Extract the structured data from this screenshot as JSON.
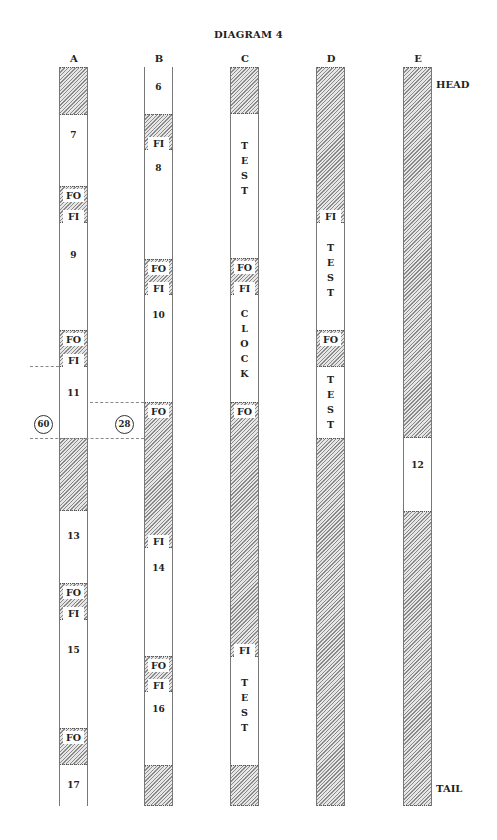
{
  "title": "DIAGRAM 4",
  "columns": [
    {
      "label": "A",
      "x": 59,
      "segments": [
        {
          "type": "hatch",
          "top": 67,
          "bottom": 115,
          "tags": []
        },
        {
          "type": "white",
          "top": 115,
          "bottom": 186,
          "number": "7",
          "number_y": 130
        },
        {
          "type": "hatch",
          "top": 186,
          "bottom": 223,
          "tags": [
            {
              "text": "FO",
              "y": 188
            },
            {
              "text": "FI",
              "y": 209
            }
          ]
        },
        {
          "type": "white",
          "top": 223,
          "bottom": 330,
          "number": "9",
          "number_y": 250
        },
        {
          "type": "hatch",
          "top": 330,
          "bottom": 367,
          "tags": [
            {
              "text": "FO",
              "y": 332
            },
            {
              "text": "FI",
              "y": 353
            }
          ]
        },
        {
          "type": "white",
          "top": 367,
          "bottom": 438,
          "number": "11",
          "number_y": 388
        },
        {
          "type": "hatch",
          "top": 438,
          "bottom": 511,
          "tags": []
        },
        {
          "type": "white",
          "top": 511,
          "bottom": 583,
          "number": "13",
          "number_y": 531
        },
        {
          "type": "hatch",
          "top": 583,
          "bottom": 620,
          "tags": [
            {
              "text": "FO",
              "y": 585
            },
            {
              "text": "FI",
              "y": 606
            }
          ]
        },
        {
          "type": "white",
          "top": 620,
          "bottom": 728,
          "number": "15",
          "number_y": 645
        },
        {
          "type": "hatch",
          "top": 728,
          "bottom": 765,
          "tags": [
            {
              "text": "FO",
              "y": 730
            }
          ]
        },
        {
          "type": "white",
          "top": 765,
          "bottom": 806,
          "number": "17",
          "number_y": 780
        }
      ]
    },
    {
      "label": "B",
      "x": 144,
      "segments": [
        {
          "type": "white",
          "top": 67,
          "bottom": 114,
          "number": "6",
          "number_y": 82
        },
        {
          "type": "hatch",
          "top": 114,
          "bottom": 150,
          "tags": [
            {
              "text": "FI",
              "y": 136
            }
          ]
        },
        {
          "type": "white",
          "top": 150,
          "bottom": 259,
          "number": "8",
          "number_y": 163
        },
        {
          "type": "hatch",
          "top": 259,
          "bottom": 295,
          "tags": [
            {
              "text": "FO",
              "y": 261
            },
            {
              "text": "FI",
              "y": 281
            }
          ]
        },
        {
          "type": "white",
          "top": 295,
          "bottom": 402,
          "number": "10",
          "number_y": 310
        },
        {
          "type": "hatch",
          "top": 402,
          "bottom": 548,
          "tags": [
            {
              "text": "FO",
              "y": 404
            },
            {
              "text": "FI",
              "y": 534
            }
          ]
        },
        {
          "type": "white",
          "top": 548,
          "bottom": 656,
          "number": "14",
          "number_y": 563
        },
        {
          "type": "hatch",
          "top": 656,
          "bottom": 692,
          "tags": [
            {
              "text": "FO",
              "y": 658
            },
            {
              "text": "FI",
              "y": 678
            }
          ]
        },
        {
          "type": "white",
          "top": 692,
          "bottom": 765,
          "number": "16",
          "number_y": 704
        },
        {
          "type": "hatch",
          "top": 765,
          "bottom": 806,
          "tags": []
        }
      ]
    },
    {
      "label": "C",
      "x": 230,
      "segments": [
        {
          "type": "hatch",
          "top": 67,
          "bottom": 114,
          "tags": []
        },
        {
          "type": "white",
          "top": 114,
          "bottom": 258,
          "word": "TEST",
          "word_y": 138
        },
        {
          "type": "hatch",
          "top": 258,
          "bottom": 295,
          "tags": [
            {
              "text": "FO",
              "y": 260
            },
            {
              "text": "FI",
              "y": 281
            }
          ]
        },
        {
          "type": "white",
          "top": 295,
          "bottom": 402,
          "word": "CLOCK",
          "word_y": 306
        },
        {
          "type": "hatch",
          "top": 402,
          "bottom": 657,
          "tags": [
            {
              "text": "FO",
              "y": 404
            },
            {
              "text": "FI",
              "y": 643
            }
          ]
        },
        {
          "type": "white",
          "top": 657,
          "bottom": 765,
          "word": "TEST",
          "word_y": 675
        },
        {
          "type": "hatch",
          "top": 765,
          "bottom": 806,
          "tags": []
        }
      ]
    },
    {
      "label": "D",
      "x": 316,
      "segments": [
        {
          "type": "hatch",
          "top": 67,
          "bottom": 223,
          "tags": [
            {
              "text": "FI",
              "y": 209
            }
          ]
        },
        {
          "type": "white",
          "top": 223,
          "bottom": 330,
          "word": "TEST",
          "word_y": 240
        },
        {
          "type": "hatch",
          "top": 330,
          "bottom": 367,
          "tags": [
            {
              "text": "FO",
              "y": 332
            }
          ]
        },
        {
          "type": "white",
          "top": 367,
          "bottom": 438,
          "word": "TEST",
          "word_y": 372
        },
        {
          "type": "hatch",
          "top": 438,
          "bottom": 806,
          "tags": []
        }
      ]
    },
    {
      "label": "E",
      "x": 403,
      "segments": [
        {
          "type": "hatch",
          "top": 67,
          "bottom": 438,
          "tags": []
        },
        {
          "type": "white",
          "top": 438,
          "bottom": 511,
          "number": "12",
          "number_y": 460
        },
        {
          "type": "hatch",
          "top": 511,
          "bottom": 806,
          "tags": []
        }
      ]
    }
  ],
  "side_labels": [
    {
      "text": "HEAD",
      "x": 436,
      "y": 79
    },
    {
      "text": "TAIL",
      "x": 436,
      "y": 783
    }
  ],
  "dashed_lines": [
    {
      "x1": 30,
      "x2": 59,
      "y": 366
    },
    {
      "x1": 90,
      "x2": 144,
      "y": 402
    },
    {
      "x1": 30,
      "x2": 144,
      "y": 438
    }
  ],
  "circles": [
    {
      "text": "60",
      "x": 34,
      "y": 415
    },
    {
      "text": "28",
      "x": 115,
      "y": 415
    }
  ]
}
